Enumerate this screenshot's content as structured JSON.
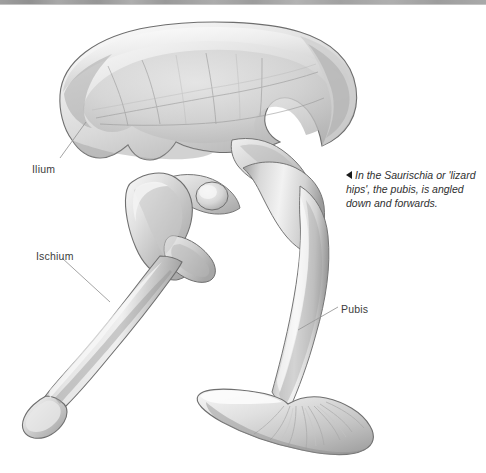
{
  "figure": {
    "background_color": "#ffffff",
    "bone_light_color": "#f0f0f0",
    "bone_mid_color": "#c9c9c9",
    "bone_shadow_color": "#8e8e8e",
    "outline_color": "#6f6f6f",
    "leader_line_color": "#9a9a9a",
    "text_color": "#3d3d3d"
  },
  "labels": [
    {
      "id": "ilium",
      "text": "Ilium",
      "x": 32,
      "y": 163
    },
    {
      "id": "ischium",
      "text": "Ischium",
      "x": 36,
      "y": 250
    },
    {
      "id": "pubis",
      "text": "Pubis",
      "x": 341,
      "y": 303
    }
  ],
  "caption": {
    "marker": "left-triangle",
    "lines": [
      "In the Saurischia or",
      "'lizard hips', the pubis,",
      "is angled down and",
      "forwards."
    ],
    "full_text": "In the Saurischia or 'lizard hips', the pubis, is angled down and forwards."
  },
  "bone_parts": [
    {
      "id": "ilium",
      "name": "Ilium",
      "description": "large blade-shaped upper pelvic bone"
    },
    {
      "id": "ischium",
      "name": "Ischium",
      "description": "rear-projecting lower bone angled down and back"
    },
    {
      "id": "pubis",
      "name": "Pubis",
      "description": "front-projecting lower bone angled down and forwards, ending in a pubic boot"
    },
    {
      "id": "acetabulum",
      "name": "Acetabulum",
      "description": "open hip socket between ilium, ischium and pubis"
    }
  ]
}
